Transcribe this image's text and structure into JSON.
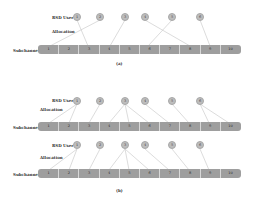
{
  "labels": {
    "user": "RSD User",
    "allocation": "Allocation",
    "subchannel": "Subchannel"
  },
  "panels": [
    {
      "id": "a",
      "caption": "(a)",
      "users": [
        "1",
        "2",
        "3",
        "4",
        "5",
        "6"
      ],
      "subchannels": [
        "1",
        "2",
        "3",
        "4",
        "5",
        "6",
        "7",
        "8",
        "9",
        "10"
      ],
      "allocation": [
        [
          1,
          3
        ],
        [
          2,
          1
        ],
        [
          3,
          4
        ],
        [
          4,
          8
        ],
        [
          5,
          6
        ],
        [
          6,
          9
        ]
      ]
    },
    {
      "id": "b1",
      "caption": "",
      "users": [
        "1",
        "2",
        "3",
        "4",
        "5",
        "6"
      ],
      "subchannels": [
        "1",
        "2",
        "3",
        "4",
        "5",
        "6",
        "7",
        "8",
        "9",
        "10"
      ],
      "allocation": [
        [
          1,
          1
        ],
        [
          1,
          2
        ],
        [
          2,
          3
        ],
        [
          3,
          4
        ],
        [
          3,
          5
        ],
        [
          3,
          6
        ],
        [
          4,
          7
        ],
        [
          5,
          8
        ],
        [
          6,
          9
        ],
        [
          6,
          10
        ]
      ]
    },
    {
      "id": "b2",
      "caption": "(b)",
      "users": [
        "1",
        "2",
        "3",
        "4",
        "5",
        "6"
      ],
      "subchannels": [
        "1",
        "2",
        "3",
        "4",
        "5",
        "6",
        "7",
        "8",
        "9",
        "10"
      ],
      "allocation": [
        [
          1,
          1
        ],
        [
          1,
          2
        ],
        [
          2,
          3
        ],
        [
          3,
          4
        ],
        [
          3,
          5
        ],
        [
          3,
          6
        ],
        [
          4,
          7
        ],
        [
          5,
          8
        ],
        [
          6,
          9
        ]
      ]
    }
  ],
  "colors": {
    "user_fill": "#bdbdbd",
    "bar_fill": "#9e9e9e",
    "line": "#c4c4c4"
  }
}
